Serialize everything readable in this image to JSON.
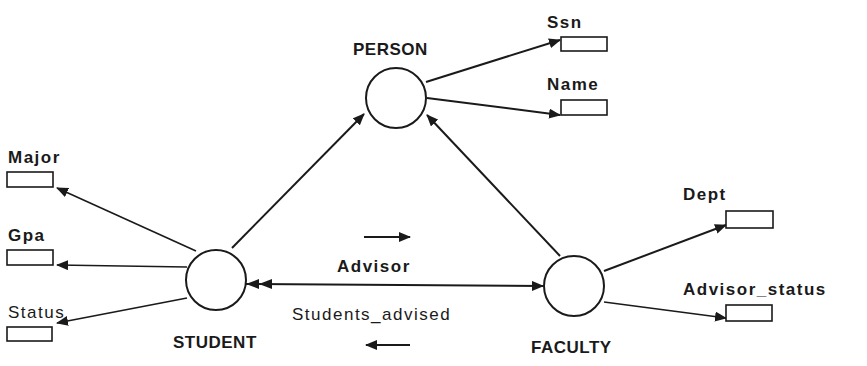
{
  "diagram": {
    "type": "object-model",
    "colors": {
      "ink": "#1a1a1a",
      "background": "#ffffff"
    },
    "entities": [
      {
        "id": "person",
        "label": "PERSON"
      },
      {
        "id": "student",
        "label": "STUDENT"
      },
      {
        "id": "faculty",
        "label": "FACULTY"
      }
    ],
    "attributes": [
      {
        "id": "ssn",
        "label": "Ssn",
        "owner": "person"
      },
      {
        "id": "name",
        "label": "Name",
        "owner": "person"
      },
      {
        "id": "major",
        "label": "Major",
        "owner": "student"
      },
      {
        "id": "gpa",
        "label": "Gpa",
        "owner": "student"
      },
      {
        "id": "status",
        "label": "Status",
        "owner": "student"
      },
      {
        "id": "dept",
        "label": "Dept",
        "owner": "faculty"
      },
      {
        "id": "advisor_status",
        "label": "Advisor_status",
        "owner": "faculty"
      }
    ],
    "inheritance": [
      {
        "from": "student",
        "to": "person"
      },
      {
        "from": "faculty",
        "to": "person"
      }
    ],
    "relationship": {
      "between": [
        "student",
        "faculty"
      ],
      "forward_label": "Advisor",
      "forward_direction": "student-to-faculty",
      "forward_cardinality": "single",
      "inverse_label": "Students_advised",
      "inverse_direction": "faculty-to-student",
      "inverse_cardinality": "many"
    }
  }
}
